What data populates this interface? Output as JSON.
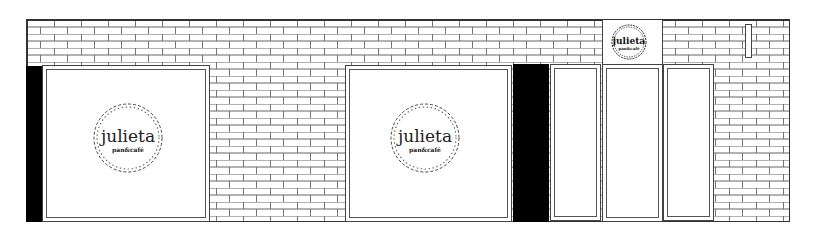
{
  "storefront": {
    "brand": {
      "name": "julieta",
      "tagline": "pan&café"
    },
    "colors": {
      "line": "#333333",
      "fill": "#ffffff",
      "solid": "#000000"
    },
    "elements": {
      "left_window_logo": {
        "name": "julieta",
        "tagline": "pan&café"
      },
      "center_window_logo": {
        "name": "julieta",
        "tagline": "pan&café"
      },
      "door_sign_logo": {
        "name": "julieta",
        "tagline": "pan&café"
      }
    }
  }
}
